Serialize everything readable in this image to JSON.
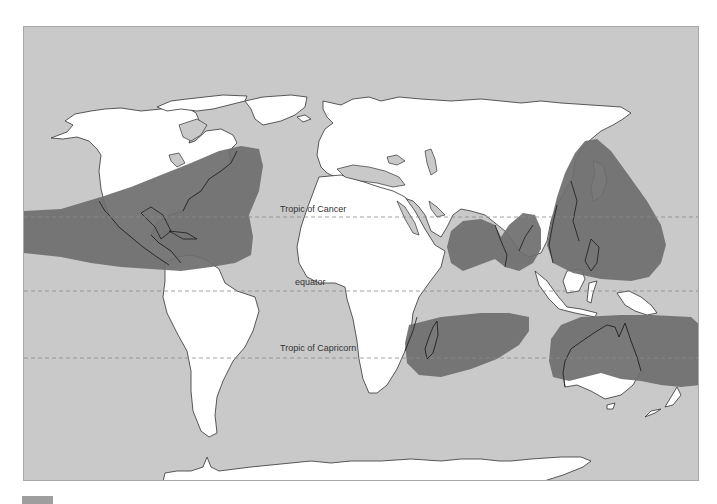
{
  "map": {
    "title": "Tropical cyclone regions world map",
    "colors": {
      "ocean": "#c9c9c9",
      "land": "#ffffff",
      "coastline": "#333333",
      "storm_zone": "#6e6e6e",
      "latitude_line": "#8a8a8a"
    },
    "latitude_lines": [
      {
        "id": "tropic-of-cancer",
        "label": "Tropic of Cancer",
        "y": 216
      },
      {
        "id": "equator",
        "label": "equator",
        "y": 290
      },
      {
        "id": "tropic-of-capricorn",
        "label": "Tropic of Capricorn",
        "y": 357
      }
    ],
    "storm_zones": [
      {
        "id": "north-atlantic-east-pacific",
        "label": "North Atlantic / East Pacific"
      },
      {
        "id": "north-indian",
        "label": "North Indian Ocean"
      },
      {
        "id": "west-pacific",
        "label": "Northwest Pacific"
      },
      {
        "id": "south-indian",
        "label": "South-West Indian Ocean"
      },
      {
        "id": "australian",
        "label": "Australian / South Pacific"
      }
    ]
  },
  "legend": {
    "swatch_color": "#9e9e9e"
  }
}
